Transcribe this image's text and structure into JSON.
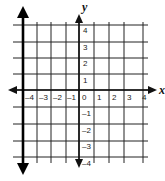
{
  "chart_data": {
    "type": "line",
    "title": "",
    "xlabel": "x",
    "ylabel": "y",
    "xlim": [
      -4.7,
      4.6
    ],
    "ylim": [
      -4.4,
      4.4
    ],
    "grid": true,
    "x_ticks": [
      "-4",
      "-3",
      "-2",
      "-1",
      "0",
      "1",
      "2",
      "3",
      "4"
    ],
    "y_ticks_positive": [
      "4",
      "3",
      "2",
      "1"
    ],
    "y_ticks_negative": [
      "-1",
      "-2",
      "-3",
      "-4"
    ],
    "series": [
      {
        "name": "vertical line x = -4",
        "equation": "x = -4",
        "points": [
          [
            -4,
            4.9
          ],
          [
            -4,
            -5
          ]
        ],
        "arrows": "both",
        "color": "#000000"
      }
    ]
  },
  "labels": {
    "x_axis": "x",
    "y_axis": "y",
    "x_ticks": [
      "–4",
      "–3",
      "–2",
      "–1",
      "0",
      "1",
      "2",
      "3",
      "4"
    ],
    "y_ticks": [
      "4",
      "3",
      "2",
      "1",
      "–1",
      "–2",
      "–3",
      "–4"
    ]
  },
  "colors": {
    "background": "#ffffff",
    "grid": "#222222",
    "line": "#000000"
  }
}
